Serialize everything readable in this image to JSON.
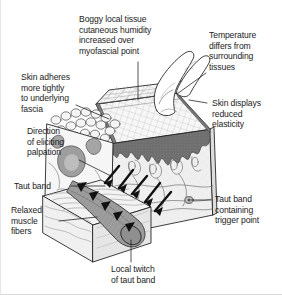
{
  "figure": {
    "colors": {
      "line": "#1b1b1b",
      "text": "#1b1b1b",
      "fascia_dark": "#6f6f6f",
      "skin_light": "#f2f2f2",
      "muscle_light": "#ebebeb",
      "trigger_gray": "#9a9a9a",
      "hatch": "#bdbdbd",
      "border": "#d8d8d8"
    }
  },
  "labels": {
    "boggy": "Boggy local tissue\ncutaneous humidity\nincreased over\nmyofascial point",
    "temperature": "Temperature\ndiffers from\nsurrounding\ntissues",
    "skin_adheres": "Skin adheres\nmore tightly\nto underlying\nfascia",
    "skin_displays": "Skin displays\nreduced\nelasticity",
    "direction": "Direction\nof eliciting\npalpation",
    "taut_band": "Taut band",
    "taut_band_trigger": "Taut band\ncontaining\ntrigger point",
    "relaxed_muscle": "Relaxed\nmuscle\nfibers",
    "local_twitch": "Local twitch\nof taut band"
  },
  "icons": {
    "finger": "finger-icon",
    "arrows": "palpation-arrows-icon",
    "tissue_block": "tissue-block-icon",
    "muscle_block": "muscle-block-icon"
  }
}
